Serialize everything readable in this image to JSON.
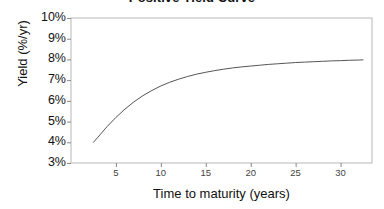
{
  "chart_data": {
    "type": "line",
    "title": "Positive Yield Curve",
    "xlabel": "Time to maturity (years)",
    "ylabel": "Yield (%/yr)",
    "xlim": [
      0,
      33.5
    ],
    "ylim": [
      3,
      10
    ],
    "xticks": [
      5,
      10,
      15,
      20,
      25,
      30
    ],
    "xticklabels": [
      "5",
      "10",
      "15",
      "20",
      "25",
      "30"
    ],
    "yticks": [
      3,
      4,
      5,
      6,
      7,
      8,
      9,
      10
    ],
    "yticklabels": [
      "3%",
      "4%",
      "5%",
      "6%",
      "7%",
      "8%",
      "9%",
      "10%"
    ],
    "grid": false,
    "legend": null,
    "line_color": "#555555",
    "plot_border_color": "#b8b8b8",
    "axis_color": "#888888",
    "background": "#ffffff",
    "series": [
      {
        "name": "Yield curve",
        "x": [
          2.5,
          3,
          4,
          5,
          6,
          7,
          8,
          9,
          10,
          11,
          12,
          13,
          14,
          15,
          16,
          17,
          18,
          19,
          20,
          21,
          22,
          23,
          24,
          25,
          26,
          27,
          28,
          29,
          30,
          31,
          32,
          32.5
        ],
        "values": [
          4.0,
          4.25,
          4.75,
          5.2,
          5.6,
          5.95,
          6.25,
          6.5,
          6.72,
          6.9,
          7.05,
          7.18,
          7.29,
          7.38,
          7.46,
          7.53,
          7.59,
          7.64,
          7.68,
          7.72,
          7.76,
          7.79,
          7.82,
          7.85,
          7.87,
          7.89,
          7.91,
          7.93,
          7.94,
          7.96,
          7.97,
          7.98
        ]
      }
    ]
  }
}
